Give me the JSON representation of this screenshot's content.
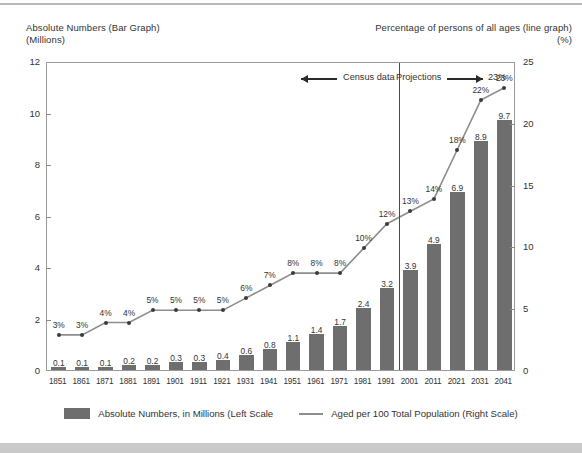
{
  "header": {
    "left_line1": "Absolute Numbers (Bar Graph)",
    "left_line2": "(Millions)",
    "right_line1": "Percentage of persons of all ages (line graph)",
    "right_line2": "(%)"
  },
  "annotations": {
    "census_label": "Census data",
    "projections_label": "Projections",
    "projection_endpoint_label": "23%",
    "divider_year": "2001"
  },
  "legend": {
    "bar_label": "Absolute Numbers, in Millions (Left Scale",
    "line_label": "Aged per 100 Total Population (Right Scale)"
  },
  "colors": {
    "bar": "#6e6e6e",
    "line": "#8d8d8d",
    "dot": "#3b3b3b",
    "frame": "#9a9a9a",
    "bottom_band": "#c9c9c9"
  },
  "chart_data": {
    "type": "bar",
    "title": "",
    "xlabel": "",
    "ylabel": "(Millions)",
    "y2label": "(%)",
    "ylim": [
      0,
      12
    ],
    "y2lim": [
      0,
      25
    ],
    "yticks": [
      "0",
      "2",
      "4",
      "6",
      "8",
      "10",
      "12"
    ],
    "ytick_values": [
      0,
      2,
      4,
      6,
      8,
      10,
      12
    ],
    "y2ticks": [
      "0",
      "5",
      "10",
      "15",
      "20",
      "25"
    ],
    "y2tick_values": [
      0,
      5,
      10,
      15,
      20,
      25
    ],
    "grid": false,
    "legend_position": "bottom",
    "categories": [
      "1851",
      "1861",
      "1871",
      "1881",
      "1891",
      "1901",
      "1911",
      "1921",
      "1931",
      "1941",
      "1951",
      "1961",
      "1971",
      "1981",
      "1991",
      "2001",
      "2011",
      "2021",
      "2031",
      "2041"
    ],
    "series": [
      {
        "name": "Absolute Numbers, in Millions (Left Scale",
        "type": "bar",
        "axis": "left",
        "values": [
          0.1,
          0.1,
          0.1,
          0.2,
          0.2,
          0.3,
          0.3,
          0.4,
          0.6,
          0.8,
          1.1,
          1.4,
          1.7,
          2.4,
          3.2,
          3.9,
          4.9,
          6.9,
          8.9,
          9.7
        ],
        "labels": [
          "0.1",
          "0.1",
          "0.1",
          "0.2",
          "0.2",
          "0.3",
          "0.3",
          "0.4",
          "0.6",
          "0.8",
          "1.1",
          "1.4",
          "1.7",
          "2.4",
          "3.2",
          "3.9",
          "4.9",
          "6.9",
          "8.9",
          "9.7"
        ]
      },
      {
        "name": "Aged per 100 Total Population (Right Scale)",
        "type": "line",
        "axis": "right",
        "values": [
          3,
          3,
          4,
          4,
          5,
          5,
          5,
          5,
          6,
          7,
          8,
          8,
          8,
          10,
          12,
          13,
          14,
          18,
          22,
          23
        ],
        "labels": [
          "3%",
          "3%",
          "4%",
          "4%",
          "5%",
          "5%",
          "5%",
          "5%",
          "6%",
          "7%",
          "8%",
          "8%",
          "8%",
          "10%",
          "12%",
          "13%",
          "14%",
          "18%",
          "22%",
          "23%"
        ]
      }
    ]
  }
}
